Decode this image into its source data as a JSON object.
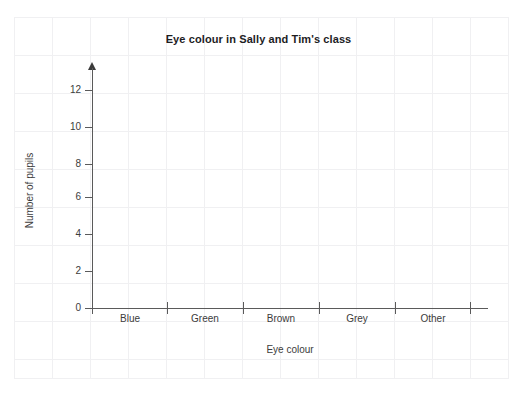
{
  "chart_data": {
    "type": "bar",
    "title": "Eye colour in Sally and Tim's class",
    "xlabel": "Eye colour",
    "ylabel": "Number of pupils",
    "categories": [
      "Blue",
      "Green",
      "Brown",
      "Grey",
      "Other"
    ],
    "values": [
      0,
      0,
      0,
      0,
      0
    ],
    "yticks": [
      0,
      2,
      4,
      6,
      8,
      10,
      12
    ],
    "ylim": [
      0,
      13
    ],
    "grid": "faint-background-paper-grid",
    "legend": "none",
    "note": "Blank bar chart template - axes drawn, no bars plotted"
  },
  "colors": {
    "axis": "#5a5a5a",
    "text": "#3c3c3c",
    "title": "#1d1d1f",
    "paper_grid": "#f0f0f2",
    "background": "#ffffff"
  }
}
